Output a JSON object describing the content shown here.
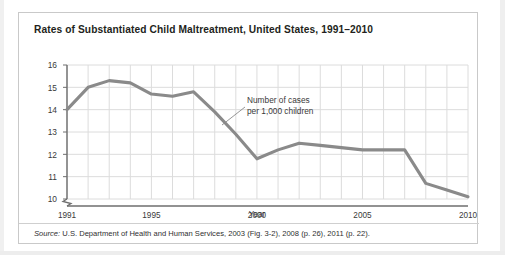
{
  "figure": {
    "title": "Rates of Substantiated Child Maltreatment, United States, 1991–2010",
    "source_prefix": "Source:",
    "source_text": " U.S. Department of Health and Human Services, 2003 (Fig. 3-2), 2008 (p. 26), 2011 (p. 22).",
    "annotation_line1": "Number of cases",
    "annotation_line2": "per 1,000 children"
  },
  "colors": {
    "line": "#8a8a8a",
    "grid": "#dcdcdc",
    "axis": "#6e6e6e",
    "text": "#231f20",
    "card_border": "#c9c9c9",
    "page_background": "#ffffff"
  },
  "chart_data": {
    "type": "line",
    "title": "Rates of Substantiated Child Maltreatment, United States, 1991–2010",
    "xlabel": "Year",
    "ylabel": "",
    "annotation": "Number of cases per 1,000 children",
    "grid": true,
    "legend": "none",
    "axis_break_y": true,
    "xlim": [
      1991,
      2010
    ],
    "ylim": [
      10,
      16
    ],
    "yticks": [
      10,
      11,
      12,
      13,
      14,
      15,
      16
    ],
    "xticks": [
      1991,
      1995,
      2000,
      2005,
      2010
    ],
    "x": [
      1991,
      1992,
      1993,
      1994,
      1995,
      1996,
      1997,
      1998,
      1999,
      2000,
      2001,
      2002,
      2003,
      2004,
      2005,
      2006,
      2007,
      2008,
      2009,
      2010
    ],
    "values": [
      14.0,
      15.0,
      15.3,
      15.2,
      14.7,
      14.6,
      14.8,
      13.9,
      12.9,
      11.8,
      12.2,
      12.5,
      12.4,
      12.3,
      12.2,
      12.2,
      12.2,
      10.7,
      10.4,
      10.1
    ],
    "series": [
      {
        "name": "Number of cases per 1,000 children",
        "values": [
          14.0,
          15.0,
          15.3,
          15.2,
          14.7,
          14.6,
          14.8,
          13.9,
          12.9,
          11.8,
          12.2,
          12.5,
          12.4,
          12.3,
          12.2,
          12.2,
          12.2,
          10.7,
          10.4,
          10.1
        ]
      }
    ]
  }
}
